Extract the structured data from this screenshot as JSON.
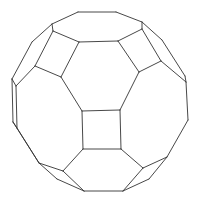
{
  "figure": {
    "stroke_color": "#333333",
    "background": "#ffffff",
    "edges": [
      [
        78,
        12,
        116,
        12
      ],
      [
        78,
        12,
        52,
        24
      ],
      [
        116,
        12,
        142,
        22
      ],
      [
        52,
        24,
        53,
        31
      ],
      [
        142,
        22,
        142,
        29
      ],
      [
        53,
        31,
        79,
        42
      ],
      [
        79,
        42,
        118,
        41
      ],
      [
        118,
        41,
        142,
        29
      ],
      [
        79,
        42,
        61,
        77
      ],
      [
        61,
        77,
        35,
        66
      ],
      [
        35,
        66,
        53,
        31
      ],
      [
        52,
        24,
        32,
        42
      ],
      [
        32,
        42,
        12,
        79
      ],
      [
        35,
        66,
        16,
        86
      ],
      [
        12,
        79,
        16,
        86
      ],
      [
        118,
        41,
        139,
        72
      ],
      [
        139,
        72,
        161,
        61
      ],
      [
        161,
        61,
        142,
        29
      ],
      [
        142,
        22,
        162,
        40
      ],
      [
        162,
        40,
        185,
        76
      ],
      [
        185,
        76,
        186,
        82
      ],
      [
        161,
        61,
        186,
        82
      ],
      [
        61,
        77,
        82,
        111
      ],
      [
        139,
        72,
        120,
        110
      ],
      [
        82,
        111,
        120,
        110
      ],
      [
        120,
        110,
        121,
        149
      ],
      [
        121,
        149,
        83,
        149
      ],
      [
        83,
        149,
        82,
        111
      ],
      [
        12,
        79,
        13,
        122
      ],
      [
        16,
        86,
        17,
        128
      ],
      [
        13,
        122,
        17,
        128
      ],
      [
        13,
        122,
        39,
        163
      ],
      [
        17,
        128,
        39,
        163
      ],
      [
        83,
        149,
        63,
        171
      ],
      [
        63,
        171,
        39,
        163
      ],
      [
        39,
        163,
        57,
        179
      ],
      [
        57,
        179,
        84,
        191
      ],
      [
        63,
        171,
        84,
        191
      ],
      [
        84,
        191,
        123,
        191
      ],
      [
        121,
        149,
        143,
        168
      ],
      [
        143,
        168,
        123,
        191
      ],
      [
        123,
        191,
        149,
        179
      ],
      [
        149,
        179,
        167,
        157
      ],
      [
        143,
        168,
        167,
        157
      ],
      [
        186,
        82,
        188,
        120
      ],
      [
        188,
        120,
        167,
        157
      ]
    ]
  }
}
